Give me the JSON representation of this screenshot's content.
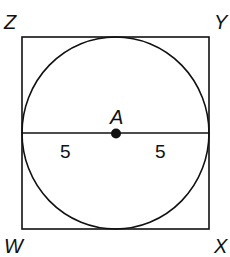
{
  "diagram": {
    "type": "geometry",
    "vertices": {
      "top_left": "Z",
      "top_right": "Y",
      "bottom_left": "W",
      "bottom_right": "X"
    },
    "center_label": "A",
    "segments": [
      {
        "label": "5",
        "position": "left radius"
      },
      {
        "label": "5",
        "position": "right radius"
      }
    ],
    "colors": {
      "stroke": "#111111",
      "background": "#ffffff"
    }
  }
}
